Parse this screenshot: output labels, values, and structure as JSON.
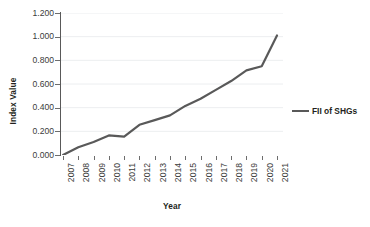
{
  "chart_data": {
    "type": "line",
    "title": "",
    "xlabel": "Year",
    "ylabel": "Index Value",
    "categories": [
      "2007",
      "2008",
      "2009",
      "2010",
      "2011",
      "2012",
      "2013",
      "2014",
      "2015",
      "2016",
      "2017",
      "2018",
      "2019",
      "2020",
      "2021"
    ],
    "series": [
      {
        "name": "FII of SHGs",
        "values": [
          0.0,
          0.065,
          0.11,
          0.165,
          0.155,
          0.255,
          0.295,
          0.335,
          0.415,
          0.475,
          0.55,
          0.625,
          0.715,
          0.75,
          1.01
        ],
        "color": "#595959"
      }
    ],
    "ylim": [
      0.0,
      1.2
    ],
    "yticks": [
      "0.000",
      "0.200",
      "0.400",
      "0.600",
      "0.800",
      "1.000",
      "1.200"
    ],
    "ytick_values": [
      0.0,
      0.2,
      0.4,
      0.6,
      0.8,
      1.0,
      1.2
    ],
    "grid": true,
    "grid_color": "#eceef0",
    "legend_position": "right",
    "legend_entries": [
      "FII of SHGs"
    ],
    "axis_color": "#595959",
    "background": "#ffffff"
  }
}
